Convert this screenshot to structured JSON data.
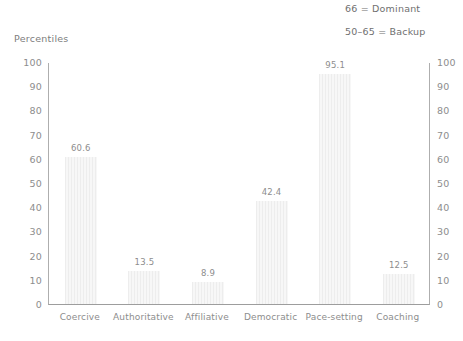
{
  "annotations": [
    {
      "text": "66 = Dominant"
    },
    {
      "text": "50–65 = Backup"
    }
  ],
  "axis": {
    "y_title": "Percentiles",
    "ticks": [
      "100",
      "90",
      "80",
      "70",
      "60",
      "50",
      "40",
      "30",
      "20",
      "10",
      "0"
    ]
  },
  "chart_data": {
    "type": "bar",
    "title": "",
    "subtitle": "",
    "xlabel": "",
    "ylabel": "Percentiles",
    "ylim": [
      0,
      100
    ],
    "yticks": [
      0,
      10,
      20,
      30,
      40,
      50,
      60,
      70,
      80,
      90,
      100
    ],
    "grid": false,
    "legend": false,
    "dual_y_axis": true,
    "categories": [
      "Coercive",
      "Authoritative",
      "Affiliative",
      "Democratic",
      "Pace-setting",
      "Coaching"
    ],
    "values": [
      60.6,
      13.5,
      8.9,
      42.4,
      95.1,
      12.5
    ],
    "value_labels": [
      "60.6",
      "13.5",
      "8.9",
      "42.4",
      "95.1",
      "12.5"
    ],
    "annotations": [
      "66 = Dominant",
      "50–65 = Backup"
    ],
    "colors": {
      "bar_fill": "#f1f1f1",
      "bar_stripe": "#ededed",
      "axis_line": "#aeaeae",
      "text": "#8d8d8d"
    }
  }
}
